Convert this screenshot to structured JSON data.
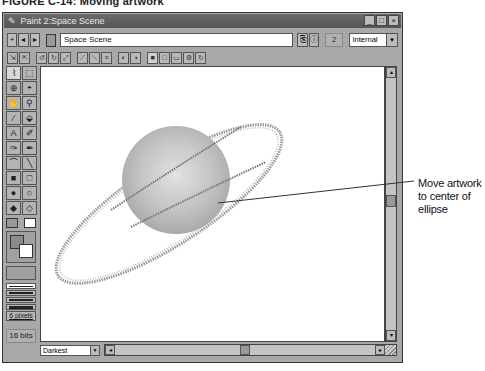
{
  "caption": "FIGURE C-14: Moving artwork",
  "window": {
    "title": "Paint 2:Space Scene",
    "title_icon": "pencil-icon",
    "controls": [
      "_",
      "□",
      "×"
    ]
  },
  "toolbar": {
    "nav_buttons": [
      "+",
      "◂",
      "▸"
    ],
    "document_name": "Space Scene",
    "member_number": "2",
    "cast_select": "Internal",
    "cast_select_arrow": "▼"
  },
  "tool_strip": {
    "groups": [
      [
        "⇲",
        "⇱"
      ],
      [
        "↺",
        "↻",
        "⤢"
      ],
      [
        "⟋",
        "⟍",
        "≡"
      ],
      [
        "◐",
        "◑"
      ],
      [
        "■",
        "□",
        "▭",
        "⚙",
        "↻"
      ]
    ]
  },
  "toolbox": {
    "tools": [
      "⬚",
      "⬚",
      "⊕",
      "◓",
      "✋",
      "🔍",
      "✎",
      "⬙",
      "A",
      "✐",
      "✑",
      "✒",
      "⌒",
      "╲",
      "■",
      "□",
      "●",
      "○",
      "◆",
      "◇"
    ],
    "line_width_label": "6 pixels",
    "color_depth": "16 bits"
  },
  "canvas": {
    "artwork": "planet with ring",
    "planet_color": "#bdbdbd",
    "ring_selected": true
  },
  "bottom_bar": {
    "ink_select": "Darkest",
    "ink_select_arrow": "▼",
    "scroll_left": "◂",
    "scroll_right": "▸"
  },
  "scrollbar": {
    "up": "▴",
    "down": "▾"
  },
  "callout": {
    "text_lines": [
      "Move artwork",
      "to center of",
      "ellipse"
    ]
  }
}
